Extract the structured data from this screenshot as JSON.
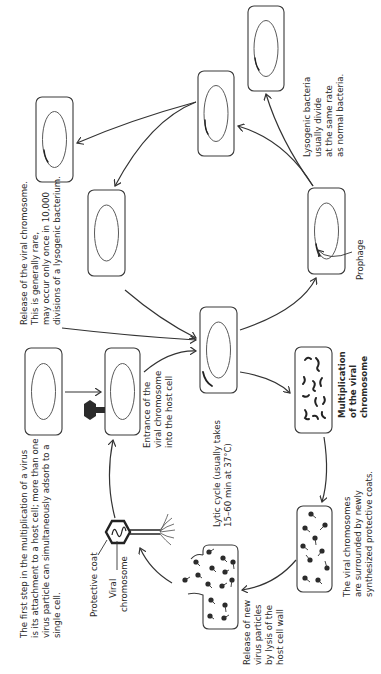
{
  "diagram": {
    "notes": {
      "attachment": [
        "The first step in the multiplication of a virus",
        "is its attachment to a host cell; more than one",
        "virus particle can simultaneously adsorb to a",
        "single cell."
      ],
      "release_chromosome": [
        "Release of  the viral chromosome.",
        "This is generally rare,",
        "may occur only once in 10,000",
        "divisions of a lysogenic bacterium."
      ],
      "lysogenic_division": [
        "Lysogenic bacteria",
        "usually divide",
        "at the same rate",
        "as normal bacteria."
      ],
      "prophage": "Prophage",
      "entrance": [
        "Entrance of  the",
        "viral chromosome",
        "into the host cell"
      ],
      "lytic_cycle": [
        "Lytic cycle (usually takes",
        "15–60 min  at 37°C)"
      ],
      "multiplication": [
        "Multiplication",
        "of the viral",
        "chromosome"
      ],
      "coats": [
        "The viral chromosomes",
        "are surrounded by newly",
        "synthesized protective coats."
      ],
      "lysis": [
        "Release of new",
        "virus particles",
        "by lysis of the",
        "host cell wall"
      ],
      "protective_coat": "Protective coat",
      "viral_chromosome": [
        "Viral",
        "chromosome"
      ]
    },
    "colors": {
      "line": "#333333",
      "fill_dark": "#2b2b2b",
      "background": "#ffffff"
    }
  }
}
